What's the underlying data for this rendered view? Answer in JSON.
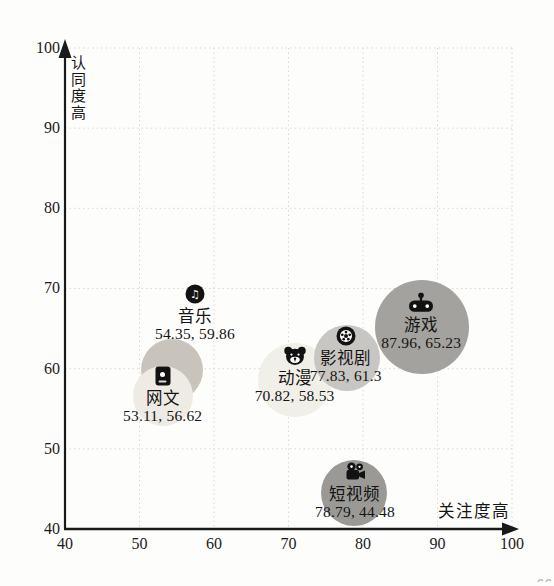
{
  "chart_data": {
    "type": "scatter",
    "subtype": "bubble",
    "title": "",
    "xlabel": "关注度高",
    "ylabel": "认同度高",
    "xlim": [
      40,
      100
    ],
    "ylim": [
      40,
      100
    ],
    "x_ticks": [
      40,
      50,
      60,
      70,
      80,
      90,
      100
    ],
    "y_ticks": [
      40,
      50,
      60,
      70,
      80,
      90,
      100
    ],
    "grid": "dotted",
    "grid_color": "#dcd9d2",
    "axis_color": "#1a1a1a",
    "points": [
      {
        "id": "music",
        "name": "音乐",
        "x": 54.35,
        "y": 59.86,
        "value_label": "54.35, 59.86",
        "icon": "music-note-icon",
        "bubble_color": "#c8c4bb",
        "radius_px": 31,
        "label_dx": 23,
        "label_dy": -76
      },
      {
        "id": "web-novel",
        "name": "网文",
        "x": 53.11,
        "y": 56.62,
        "value_label": "53.11, 56.62",
        "icon": "ebook-icon",
        "bubble_color": "#edebe3",
        "radius_px": 30,
        "label_dx": 0,
        "label_dy": -20
      },
      {
        "id": "anime",
        "name": "动漫",
        "x": 70.82,
        "y": 58.53,
        "value_label": "70.82, 58.53",
        "icon": "bear-icon",
        "bubble_color": "#f0efe8",
        "radius_px": 37,
        "label_dx": 0,
        "label_dy": -24
      },
      {
        "id": "film-tv",
        "name": "影视剧",
        "x": 77.83,
        "y": 61.3,
        "value_label": "77.83, 61.3",
        "icon": "film-reel-icon",
        "bubble_color": "#c7c6c2",
        "radius_px": 33,
        "label_dx": -1,
        "label_dy": -22
      },
      {
        "id": "game",
        "name": "游戏",
        "x": 87.96,
        "y": 65.23,
        "value_label": "87.96, 65.23",
        "icon": "gamepad-icon",
        "bubble_color": "#a3a29e",
        "radius_px": 47,
        "label_dx": -1,
        "label_dy": -24
      },
      {
        "id": "short-video",
        "name": "短视频",
        "x": 78.79,
        "y": 44.48,
        "value_label": "78.79, 44.48",
        "icon": "movie-camera-icon",
        "bubble_color": "#9a9995",
        "radius_px": 33,
        "label_dx": 1,
        "label_dy": -21
      }
    ]
  }
}
